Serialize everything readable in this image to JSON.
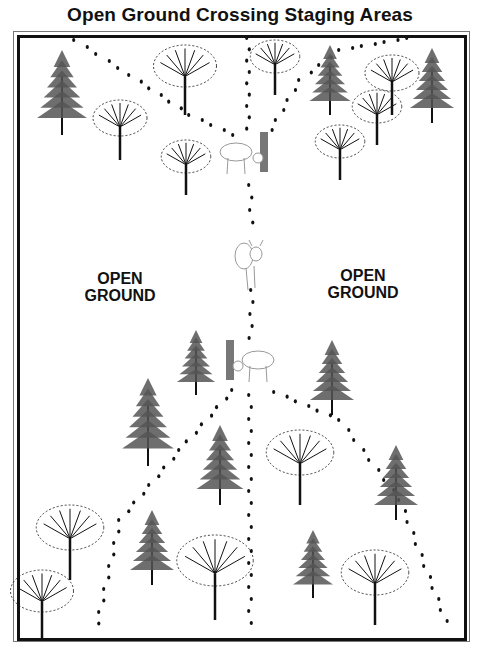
{
  "title": "Open Ground Crossing Staging Areas",
  "labels": {
    "left": {
      "line1": "OPEN",
      "line2": "GROUND"
    },
    "right": {
      "line1": "OPEN",
      "line2": "GROUND"
    }
  },
  "colors": {
    "ink": "#111111",
    "tree_grey": "#555555",
    "bark_grey": "#777777",
    "deer_outline": "#999999"
  },
  "elements": {
    "trees": [
      {
        "type": "conifer",
        "x": 62,
        "y": 50,
        "h": 85
      },
      {
        "type": "deciduous",
        "x": 185,
        "y": 45,
        "h": 70
      },
      {
        "type": "deciduous",
        "x": 120,
        "y": 100,
        "h": 60
      },
      {
        "type": "deciduous",
        "x": 186,
        "y": 140,
        "h": 55
      },
      {
        "type": "deciduous",
        "x": 275,
        "y": 40,
        "h": 55
      },
      {
        "type": "conifer",
        "x": 330,
        "y": 45,
        "h": 70
      },
      {
        "type": "deciduous",
        "x": 392,
        "y": 55,
        "h": 60
      },
      {
        "type": "deciduous",
        "x": 377,
        "y": 90,
        "h": 55
      },
      {
        "type": "conifer",
        "x": 432,
        "y": 48,
        "h": 75
      },
      {
        "type": "deciduous",
        "x": 340,
        "y": 125,
        "h": 55
      },
      {
        "type": "conifer",
        "x": 196,
        "y": 330,
        "h": 65
      },
      {
        "type": "conifer",
        "x": 332,
        "y": 340,
        "h": 75
      },
      {
        "type": "conifer",
        "x": 148,
        "y": 378,
        "h": 88
      },
      {
        "type": "conifer",
        "x": 220,
        "y": 425,
        "h": 80
      },
      {
        "type": "deciduous",
        "x": 300,
        "y": 430,
        "h": 75
      },
      {
        "type": "conifer",
        "x": 396,
        "y": 445,
        "h": 75
      },
      {
        "type": "deciduous",
        "x": 70,
        "y": 505,
        "h": 75
      },
      {
        "type": "conifer",
        "x": 152,
        "y": 510,
        "h": 75
      },
      {
        "type": "deciduous",
        "x": 215,
        "y": 535,
        "h": 85
      },
      {
        "type": "conifer",
        "x": 313,
        "y": 530,
        "h": 68
      },
      {
        "type": "deciduous",
        "x": 375,
        "y": 550,
        "h": 75
      },
      {
        "type": "deciduous",
        "x": 42,
        "y": 570,
        "h": 70
      }
    ],
    "deer": [
      {
        "x": 222,
        "y": 140,
        "pose": "rubbing-tree-right"
      },
      {
        "x": 236,
        "y": 238,
        "pose": "facing-forward"
      },
      {
        "x": 220,
        "y": 348,
        "pose": "rubbing-tree-left"
      }
    ],
    "trails": [
      {
        "name": "trail-top-left",
        "points": [
          [
            75,
            40
          ],
          [
            130,
            75
          ],
          [
            190,
            115
          ],
          [
            245,
            140
          ]
        ]
      },
      {
        "name": "trail-top-center",
        "points": [
          [
            248,
            38
          ],
          [
            248,
            140
          ]
        ]
      },
      {
        "name": "trail-top-right",
        "points": [
          [
            408,
            38
          ],
          [
            340,
            50
          ],
          [
            300,
            80
          ],
          [
            265,
            140
          ]
        ]
      },
      {
        "name": "trail-center",
        "points": [
          [
            250,
            185
          ],
          [
            252,
            235
          ]
        ]
      },
      {
        "name": "trail-center-lower",
        "points": [
          [
            252,
            290
          ],
          [
            250,
            350
          ]
        ]
      },
      {
        "name": "trail-bottom-left",
        "points": [
          [
            233,
            390
          ],
          [
            180,
            450
          ],
          [
            120,
            520
          ],
          [
            95,
            635
          ]
        ]
      },
      {
        "name": "trail-bottom-center",
        "points": [
          [
            250,
            395
          ],
          [
            250,
            635
          ]
        ]
      },
      {
        "name": "trail-bottom-right",
        "points": [
          [
            275,
            392
          ],
          [
            340,
            420
          ],
          [
            400,
            500
          ],
          [
            450,
            632
          ]
        ]
      }
    ]
  }
}
